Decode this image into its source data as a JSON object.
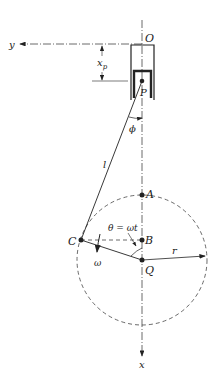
{
  "diagram": {
    "labels": {
      "origin": "O",
      "y_axis": "y",
      "x_axis": "x",
      "piston_disp": "x",
      "piston_disp_sub": "p",
      "piston_pin": "P",
      "phi": "ϕ",
      "rod_length": "l",
      "point_a": "A",
      "point_b": "B",
      "point_c": "C",
      "center": "Q",
      "radius": "r",
      "theta": "θ = ωt",
      "omega": "ω"
    },
    "colors": {
      "line": "#222222",
      "background": "#ffffff"
    }
  }
}
